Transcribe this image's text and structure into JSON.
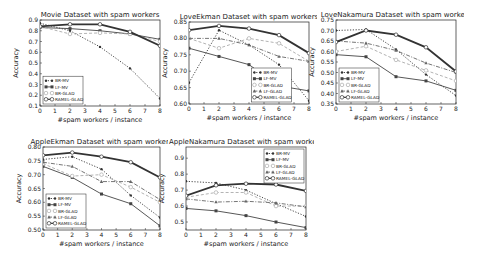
{
  "figure": {
    "background": "#ffffff",
    "line_color": "#333333",
    "light_color": "#999999"
  },
  "legend_styles": {
    "BR-MV": {
      "dash": "1.2,1.6",
      "width": 0.9,
      "marker": "dot",
      "color": "#333333"
    },
    "LF-MV": {
      "dash": "",
      "width": 0.9,
      "marker": "square",
      "color": "#444444"
    },
    "BR-GLAD": {
      "dash": "3,2",
      "width": 0.9,
      "marker": "circle",
      "color": "#aaaaaa"
    },
    "LF-GLAD": {
      "dash": "4,1.5,1,1.5",
      "width": 0.9,
      "marker": "triangle",
      "color": "#666666"
    },
    "RAMEL-GLAD": {
      "dash": "",
      "width": 1.8,
      "marker": "circle",
      "color": "#333333"
    }
  },
  "chart_data": [
    {
      "type": "line",
      "title": "Movie Dataset with spam workers",
      "xlabel": "#spam workers / instance",
      "ylabel": "Accuracy",
      "x": [
        0,
        2,
        4,
        6,
        8
      ],
      "xticks": [
        "0",
        "1",
        "2",
        "3",
        "4",
        "5",
        "6",
        "7",
        "8"
      ],
      "xlim": [
        0,
        8
      ],
      "ylim": [
        0.1,
        0.9
      ],
      "yticks": [
        "0.1",
        "0.2",
        "0.3",
        "0.4",
        "0.5",
        "0.6",
        "0.7",
        "0.8",
        "0.9"
      ],
      "grid": false,
      "legend_position": "lower left",
      "box": {
        "left": 40,
        "top": 20,
        "width": 120,
        "height": 86
      },
      "series": [
        {
          "name": "BR-MV",
          "values": [
            0.87,
            0.8,
            0.65,
            0.45,
            0.17
          ]
        },
        {
          "name": "LF-MV",
          "values": [
            0.83,
            0.82,
            0.8,
            0.77,
            0.72
          ]
        },
        {
          "name": "BR-GLAD",
          "values": [
            0.84,
            0.77,
            0.78,
            0.77,
            0.7
          ]
        },
        {
          "name": "RAMEL-GLAD",
          "values": [
            0.84,
            0.86,
            0.86,
            0.79,
            0.66
          ]
        }
      ]
    },
    {
      "type": "line",
      "title": "LoveEkman Dataset with spam workers",
      "xlabel": "#spam workers / instance",
      "ylabel": "Accuracy",
      "x": [
        0,
        2,
        4,
        6,
        8
      ],
      "xticks": [
        "0",
        "1",
        "2",
        "3",
        "4",
        "5",
        "6",
        "7",
        "8"
      ],
      "xlim": [
        0,
        8
      ],
      "ylim": [
        0.6,
        0.85
      ],
      "yticks": [
        "0.60",
        "0.65",
        "0.70",
        "0.75",
        "0.80",
        "0.85"
      ],
      "grid": false,
      "legend_position": "lower center-right",
      "box": {
        "left": 189,
        "top": 22,
        "width": 120,
        "height": 82
      },
      "series": [
        {
          "name": "BR-MV",
          "values": [
            0.665,
            0.825,
            0.78,
            0.72,
            0.61
          ]
        },
        {
          "name": "LF-MV",
          "values": [
            0.77,
            0.745,
            0.72,
            0.655,
            0.64
          ]
        },
        {
          "name": "BR-GLAD",
          "values": [
            0.8,
            0.77,
            0.8,
            0.785,
            0.73
          ]
        },
        {
          "name": "LF-GLAD",
          "values": [
            0.8,
            0.8,
            0.78,
            0.745,
            0.73
          ]
        },
        {
          "name": "RAMEL-GLAD",
          "values": [
            0.825,
            0.838,
            0.83,
            0.81,
            0.755
          ]
        }
      ]
    },
    {
      "type": "line",
      "title": "LoveNakamura Dataset with spam workers",
      "xlabel": "#spam workers / instance",
      "ylabel": "Accuracy",
      "x": [
        0,
        2,
        4,
        6,
        8
      ],
      "xticks": [
        "0",
        "1",
        "2",
        "3",
        "4",
        "5",
        "6",
        "7",
        "8"
      ],
      "xlim": [
        0,
        8
      ],
      "ylim": [
        0.35,
        0.75
      ],
      "yticks": [
        "0.35",
        "0.40",
        "0.45",
        "0.50",
        "0.55",
        "0.60",
        "0.65",
        "0.70",
        "0.75"
      ],
      "grid": false,
      "legend_position": "lower left",
      "box": {
        "left": 336,
        "top": 20,
        "width": 120,
        "height": 84
      },
      "series": [
        {
          "name": "BR-MV",
          "values": [
            0.7,
            0.705,
            0.61,
            0.49,
            0.39
          ]
        },
        {
          "name": "LF-MV",
          "values": [
            0.585,
            0.575,
            0.48,
            0.46,
            0.415
          ]
        },
        {
          "name": "BR-GLAD",
          "values": [
            0.6,
            0.625,
            0.56,
            0.51,
            0.46
          ]
        },
        {
          "name": "LF-GLAD",
          "values": [
            0.65,
            0.64,
            0.605,
            0.545,
            0.5
          ]
        },
        {
          "name": "RAMEL-GLAD",
          "values": [
            0.645,
            0.7,
            0.68,
            0.62,
            0.505
          ]
        }
      ]
    },
    {
      "type": "line",
      "title": "AppleEkman Dataset with spam workers",
      "xlabel": "#spam workers / instance",
      "ylabel": "Accuracy",
      "x": [
        0,
        2,
        4,
        6,
        8
      ],
      "xticks": [
        "0",
        "1",
        "2",
        "3",
        "4",
        "5",
        "6",
        "7",
        "8"
      ],
      "xlim": [
        0,
        8
      ],
      "ylim": [
        0.5,
        0.8
      ],
      "yticks": [
        "0.50",
        "0.55",
        "0.60",
        "0.65",
        "0.70",
        "0.75",
        "0.80"
      ],
      "grid": false,
      "legend_position": "lower left",
      "box": {
        "left": 43,
        "top": 147,
        "width": 117,
        "height": 83
      },
      "series": [
        {
          "name": "BR-MV",
          "values": [
            0.755,
            0.765,
            0.72,
            0.625,
            0.545
          ]
        },
        {
          "name": "LF-MV",
          "values": [
            0.73,
            0.69,
            0.63,
            0.595,
            0.515
          ]
        },
        {
          "name": "BR-GLAD",
          "values": [
            0.74,
            0.695,
            0.7,
            0.655,
            0.6
          ]
        },
        {
          "name": "LF-GLAD",
          "values": [
            0.745,
            0.73,
            0.675,
            0.675,
            0.61
          ]
        },
        {
          "name": "RAMEL-GLAD",
          "values": [
            0.77,
            0.78,
            0.765,
            0.745,
            0.69
          ]
        }
      ]
    },
    {
      "type": "line",
      "title": "AppleNakamura Dataset with spam workers",
      "xlabel": "#spam workers / instance",
      "ylabel": "Accuracy",
      "x": [
        0,
        2,
        4,
        6,
        8
      ],
      "xticks": [
        "0",
        "1",
        "2",
        "3",
        "4",
        "5",
        "6",
        "7",
        "8"
      ],
      "xlim": [
        0,
        8
      ],
      "ylim": [
        0.45,
        0.97
      ],
      "yticks": [
        "0.5",
        "0.6",
        "0.7",
        "0.8",
        "0.9"
      ],
      "grid": false,
      "legend_position": "upper right",
      "box": {
        "left": 186,
        "top": 147,
        "width": 120,
        "height": 83
      },
      "series": [
        {
          "name": "BR-MV",
          "values": [
            0.755,
            0.745,
            0.7,
            0.615,
            0.535
          ]
        },
        {
          "name": "LF-MV",
          "values": [
            0.585,
            0.57,
            0.54,
            0.5,
            0.465
          ]
        },
        {
          "name": "BR-GLAD",
          "values": [
            0.655,
            0.685,
            0.685,
            0.6,
            0.6
          ]
        },
        {
          "name": "LF-GLAD",
          "values": [
            0.645,
            0.625,
            0.63,
            0.62,
            0.595
          ]
        },
        {
          "name": "RAMEL-GLAD",
          "values": [
            0.665,
            0.73,
            0.74,
            0.735,
            0.695
          ]
        }
      ]
    }
  ]
}
